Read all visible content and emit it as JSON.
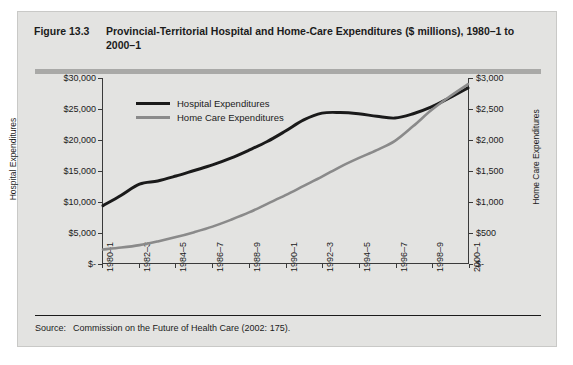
{
  "figure": {
    "number": "Figure 13.3",
    "title": "Provincial-Territorial Hospital and Home-Care Expenditures ($ millions), 1980–1 to 2000–1",
    "source_label": "Source:",
    "source_text": "Commission on the Future of Health Care (2002: 175)."
  },
  "chart_data": {
    "type": "line",
    "title": "Provincial-Territorial Hospital and Home-Care Expenditures ($ millions), 1980–1 to 2000–1",
    "xlabel": "",
    "ylabel": "Hospital Expenditures",
    "y2label": "Home Care Expenditures",
    "grid": false,
    "legend_position": "top-left-inside",
    "categories": [
      "1980–1",
      "1981–2",
      "1982–3",
      "1983–4",
      "1984–5",
      "1985–6",
      "1986–7",
      "1987–8",
      "1988–9",
      "1989–90",
      "1990–1",
      "1991–2",
      "1992–3",
      "1993–4",
      "1994–5",
      "1995–6",
      "1996–7",
      "1997–8",
      "1998–9",
      "1999–2000",
      "2000–1"
    ],
    "tick_labels_shown": [
      "1980–1",
      "1982–3",
      "1984–5",
      "1986–7",
      "1988–9",
      "1990–1",
      "1992–3",
      "1994–5",
      "1996–7",
      "1998–9",
      "2000–1"
    ],
    "ylim": [
      0,
      30000
    ],
    "yticks": [
      0,
      5000,
      10000,
      15000,
      20000,
      25000,
      30000
    ],
    "ytick_labels": [
      "$-",
      "$5,000",
      "$10,000",
      "$15,000",
      "$20,000",
      "$25,000",
      "$30,000"
    ],
    "y2lim": [
      0,
      3000
    ],
    "y2ticks": [
      0,
      500,
      1000,
      1500,
      2000,
      2500,
      3000
    ],
    "y2tick_labels": [
      "$-",
      "$500",
      "$1,000",
      "$1,500",
      "$2,000",
      "$2,500",
      "$3,000"
    ],
    "series": [
      {
        "name": "Hospital Expenditures",
        "axis": "left",
        "color": "#1a1a1a",
        "values": [
          9300,
          11000,
          12800,
          13300,
          14100,
          15000,
          15900,
          17000,
          18300,
          19700,
          21400,
          23200,
          24300,
          24400,
          24200,
          23800,
          23500,
          24200,
          25300,
          26800,
          28400
        ]
      },
      {
        "name": "Home Care Expenditures",
        "axis": "right",
        "color": "#8a8a8a",
        "values": [
          220,
          250,
          290,
          350,
          420,
          500,
          590,
          700,
          820,
          960,
          1100,
          1250,
          1400,
          1560,
          1700,
          1830,
          1980,
          2220,
          2480,
          2700,
          2900
        ]
      }
    ]
  },
  "legend": {
    "items": [
      {
        "label": "Hospital Expenditures",
        "color": "#1a1a1a"
      },
      {
        "label": "Home Care Expenditures",
        "color": "#8a8a8a"
      }
    ]
  }
}
